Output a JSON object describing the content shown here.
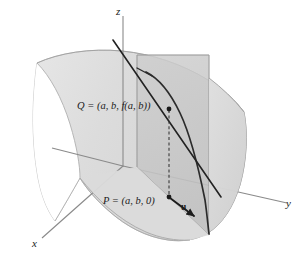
{
  "figure": {
    "background_color": "#ffffff"
  },
  "axes": {
    "z": {
      "label": "z",
      "name": "z-axis"
    },
    "y": {
      "label": "y",
      "name": "y-axis"
    },
    "x": {
      "label": "x",
      "name": "x-axis"
    },
    "color": "#8a8a8a"
  },
  "points": {
    "Q": {
      "label": "Q = (a, b, f(a, b))",
      "name": "point-Q"
    },
    "P": {
      "label": "P = (a, b, 0)",
      "name": "point-P"
    }
  },
  "vector": {
    "u": {
      "label": "u",
      "name": "unit-vector-u"
    }
  },
  "colors": {
    "surface_fill": "#dedede",
    "surface_fill_light": "#e8e8e8",
    "plane_fill": "#c9c9c9",
    "plane_fill_front": "#d4d4d4",
    "curve_stroke": "#2b2b2b",
    "tangent_stroke": "#222222",
    "axis_stroke": "#8a8a8a",
    "dashed_stroke": "#3a3a3a",
    "text": "#1b1b1b"
  },
  "elements": {
    "surface_name": "surface-z-equals-f-xy",
    "plane_name": "vertical-cutting-plane",
    "curve_name": "curve-of-intersection",
    "tangent_name": "tangent-line-at-Q",
    "dashed_name": "dashed-segment-P-to-Q",
    "arrow_name": "u-vector-arrow"
  }
}
